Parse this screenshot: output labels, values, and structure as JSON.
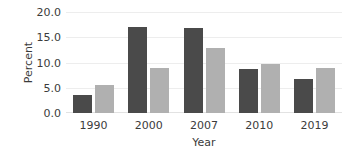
{
  "chart_data": {
    "type": "bar",
    "title": "",
    "subtitle": "",
    "xlabel": "Year",
    "ylabel": "Percent",
    "categories": [
      "1990",
      "2000",
      "2007",
      "2010",
      "2019"
    ],
    "series": [
      {
        "name": "series-1",
        "color": "#4a4a4a",
        "values": [
          3.5,
          17.0,
          16.9,
          8.7,
          6.8
        ]
      },
      {
        "name": "series-2",
        "color": "#b0b0b0",
        "values": [
          5.5,
          9.0,
          12.8,
          9.7,
          9.0
        ]
      }
    ],
    "ylim": [
      0.0,
      20.0
    ],
    "ytick_labels": [
      "0.0",
      "5.0",
      "10.0",
      "15.0",
      "20.0"
    ],
    "ytick_values": [
      0.0,
      5.0,
      10.0,
      15.0,
      20.0
    ],
    "grid": true,
    "grid_color": "#ededed",
    "legend": false,
    "legend_position": "none",
    "background": "#ffffff",
    "text_color": "#3b3b3b",
    "annotations": []
  }
}
